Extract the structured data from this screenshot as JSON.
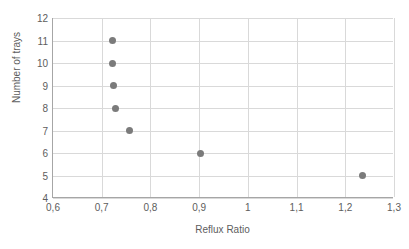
{
  "chart_data": {
    "type": "scatter",
    "title": "",
    "xlabel": "Reflux Ratio",
    "ylabel": "Number of trays",
    "xlim": [
      0.6,
      1.3
    ],
    "ylim": [
      4,
      12
    ],
    "grid": true,
    "legend": "none",
    "marker_color": "#7b7b7b",
    "gridline_color": "#d9d9d9",
    "axis_color": "#a6a6a6",
    "text_color": "#5d5d5d",
    "xticks": [
      0.6,
      0.7,
      0.8,
      0.9,
      1.0,
      1.1,
      1.2,
      1.3
    ],
    "xtick_labels": [
      "0,6",
      "0,7",
      "0,8",
      "0,9",
      "1",
      "1,1",
      "1,2",
      "1,3"
    ],
    "yticks": [
      4,
      5,
      6,
      7,
      8,
      9,
      10,
      11,
      12
    ],
    "ytick_labels": [
      "4",
      "5",
      "6",
      "7",
      "8",
      "9",
      "10",
      "11",
      "12"
    ],
    "series": [
      {
        "name": "Reflux ratio vs trays",
        "points": [
          {
            "x": 1.235,
            "y": 5
          },
          {
            "x": 0.902,
            "y": 6
          },
          {
            "x": 0.757,
            "y": 7
          },
          {
            "x": 0.728,
            "y": 8
          },
          {
            "x": 0.724,
            "y": 9
          },
          {
            "x": 0.723,
            "y": 10
          },
          {
            "x": 0.722,
            "y": 11
          }
        ]
      }
    ]
  }
}
